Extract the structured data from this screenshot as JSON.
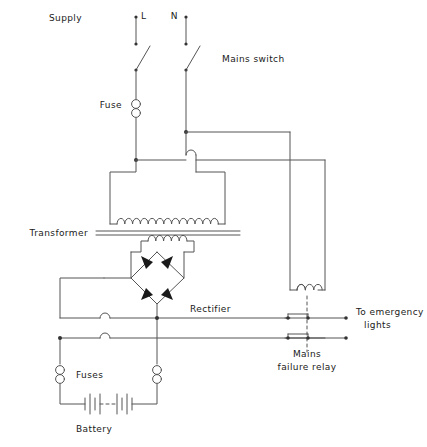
{
  "diagram": {
    "type": "schematic",
    "stroke_color": "#555555",
    "text_color": "#1a1a1a",
    "background": "#ffffff",
    "line_width": 1
  },
  "labels": {
    "supply": "Supply",
    "line_terminal": "L",
    "neutral_terminal": "N",
    "mains_switch": "Mains switch",
    "fuse": "Fuse",
    "transformer": "Transformer",
    "rectifier": "Rectifier",
    "mains_failure_relay_line1": "Mains",
    "mains_failure_relay_line2": "failure relay",
    "emergency_lights_line1": "To emergency",
    "emergency_lights_line2": "lights",
    "fuses": "Fuses",
    "battery": "Battery"
  },
  "components": {
    "mains_switch_poles": 2,
    "primary_fuse_count": 1,
    "transformer_primary_turns": 13,
    "transformer_secondary_turns": 5,
    "transformer_core_lines": 2,
    "rectifier_diodes": 4,
    "relay_coil_turns": 5,
    "relay_contact_sets": 2,
    "battery_fuses": 2,
    "battery_cells": 2,
    "wire_hops": 3
  }
}
